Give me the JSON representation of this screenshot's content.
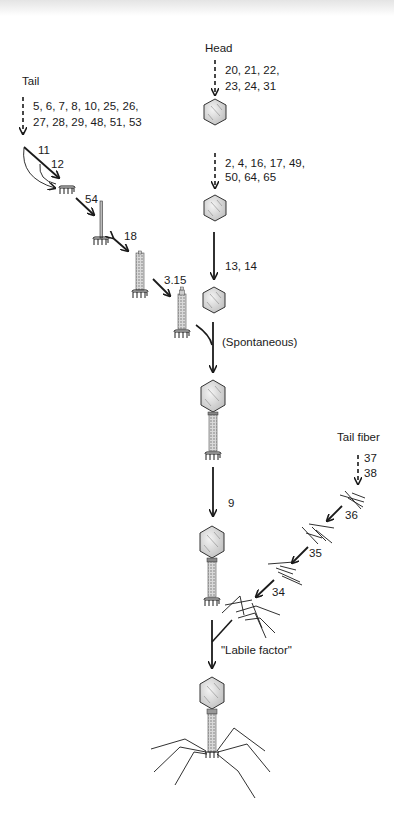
{
  "diagram": {
    "branches": {
      "tail": {
        "label": "Tail",
        "initial_genes_line1": "5, 6, 7, 8, 10, 25, 26,",
        "initial_genes_line2": "27, 28, 29, 48, 51, 53",
        "steps": [
          {
            "gene": "11"
          },
          {
            "gene": "12"
          },
          {
            "gene": "54"
          },
          {
            "gene": "18"
          },
          {
            "gene": "3.15"
          }
        ]
      },
      "head": {
        "label": "Head",
        "initial_genes_line1": "20, 21, 22,",
        "initial_genes_line2": "23, 24, 31",
        "second_genes_line1": "2, 4, 16, 17, 49,",
        "second_genes_line2": "50, 64, 65",
        "third_genes": "13, 14"
      },
      "tail_fiber": {
        "label": "Tail fiber",
        "initial_gene_1": "37",
        "initial_gene_2": "38",
        "steps": [
          {
            "gene": "36"
          },
          {
            "gene": "35"
          },
          {
            "gene": "34"
          }
        ]
      }
    },
    "joins": {
      "head_tail": "(Spontaneous)",
      "neck_step": "9",
      "fiber_attach": "\"Labile factor\""
    },
    "colors": {
      "ink": "#1a1a1a",
      "stipple": "#9a9a9a",
      "head_fill": "#e6e6e6"
    }
  }
}
